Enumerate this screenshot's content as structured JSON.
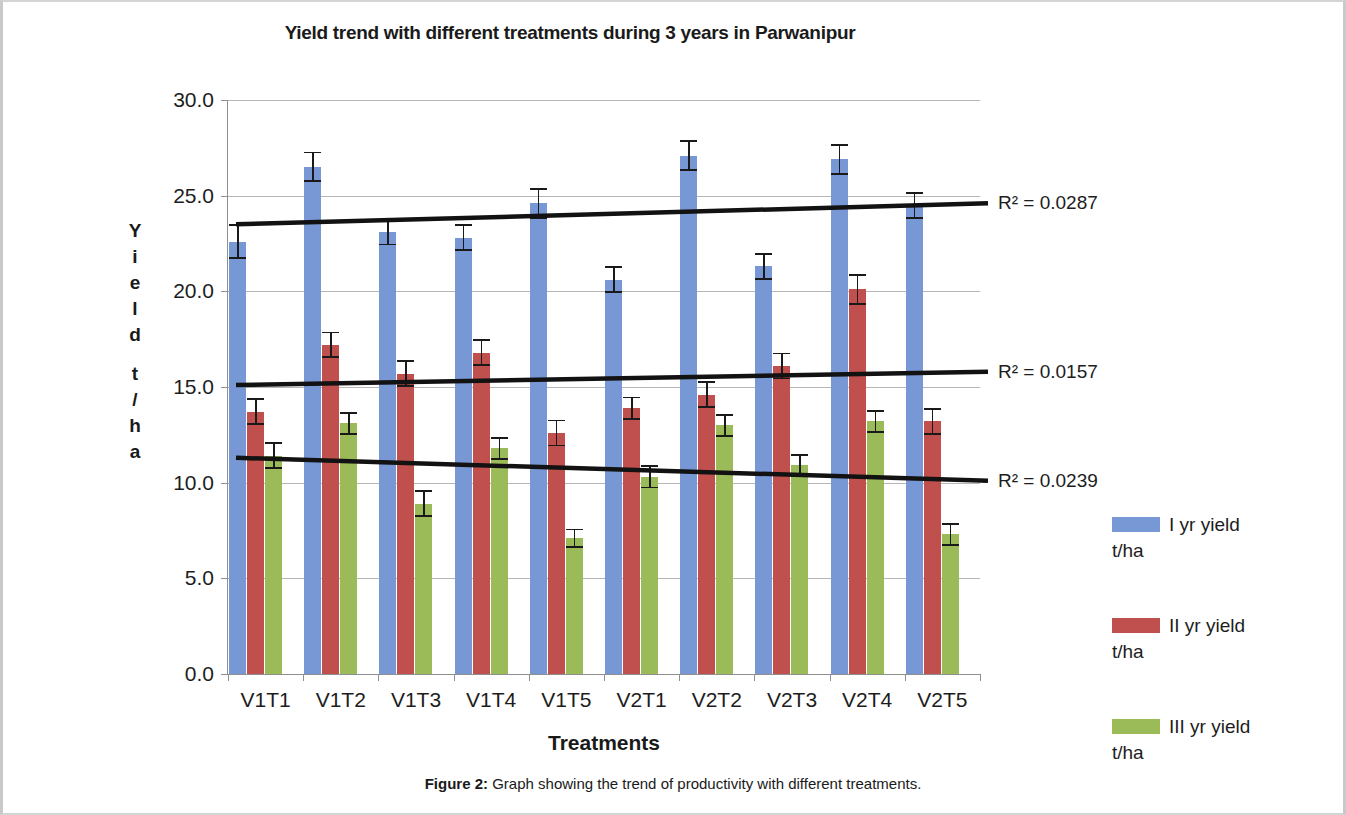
{
  "chart_data": {
    "type": "bar",
    "title": "Yield trend with different treatments during 3 years in Parwanipur",
    "xlabel": "Treatments",
    "ylabel": "Yield t/ha",
    "ylim": [
      0.0,
      30.0
    ],
    "yticks": [
      "0.0",
      "5.0",
      "10.0",
      "15.0",
      "20.0",
      "25.0",
      "30.0"
    ],
    "ytick_values": [
      0,
      5,
      10,
      15,
      20,
      25,
      30
    ],
    "grid": true,
    "legend_position": "right",
    "categories": [
      "V1T1",
      "V1T2",
      "V1T3",
      "V1T4",
      "V1T5",
      "V2T1",
      "V2T2",
      "V2T3",
      "V2T4",
      "V2T5"
    ],
    "series": [
      {
        "name": "I yr yield t/ha",
        "color": "#7798d4",
        "values": [
          22.6,
          26.5,
          23.1,
          22.8,
          24.6,
          20.6,
          27.1,
          21.3,
          26.9,
          24.5
        ],
        "errors": [
          0.9,
          0.8,
          0.7,
          0.7,
          0.8,
          0.7,
          0.8,
          0.7,
          0.8,
          0.7
        ]
      },
      {
        "name": "II yr yield t/ha",
        "color": "#c0504d",
        "values": [
          13.7,
          17.2,
          15.7,
          16.8,
          12.6,
          13.9,
          14.6,
          16.1,
          20.1,
          13.2
        ],
        "errors": [
          0.7,
          0.7,
          0.7,
          0.7,
          0.7,
          0.6,
          0.7,
          0.7,
          0.8,
          0.7
        ]
      },
      {
        "name": "III yr yield t/ha",
        "color": "#9bbb59",
        "values": [
          11.4,
          13.1,
          8.9,
          11.8,
          7.1,
          10.3,
          13.0,
          10.9,
          13.2,
          7.3
        ],
        "errors": [
          0.7,
          0.6,
          0.7,
          0.6,
          0.5,
          0.6,
          0.6,
          0.6,
          0.6,
          0.6
        ]
      }
    ],
    "trendlines": [
      {
        "series": "I yr yield t/ha",
        "r2_label": "R² = 0.0287",
        "y_start": 23.5,
        "y_end": 24.6
      },
      {
        "series": "II yr yield t/ha",
        "r2_label": "R² = 0.0157",
        "y_start": 15.1,
        "y_end": 15.8
      },
      {
        "series": "III yr yield t/ha",
        "r2_label": "R² = 0.0239",
        "y_start": 11.3,
        "y_end": 10.1
      }
    ]
  },
  "legend": {
    "items": [
      {
        "line1": "I yr yield",
        "line2": "t/ha",
        "color": "#7798d4"
      },
      {
        "line1": "II yr yield",
        "line2": "t/ha",
        "color": "#c0504d"
      },
      {
        "line1": "III yr yield",
        "line2": "t/ha",
        "color": "#9bbb59"
      }
    ]
  },
  "y_axis_title_letters": [
    "Y",
    "i",
    "e",
    "l",
    "d",
    "",
    "t",
    "/",
    "h",
    "a"
  ],
  "caption": {
    "label": "Figure 2:",
    "text": " Graph showing the trend of productivity with different treatments."
  }
}
